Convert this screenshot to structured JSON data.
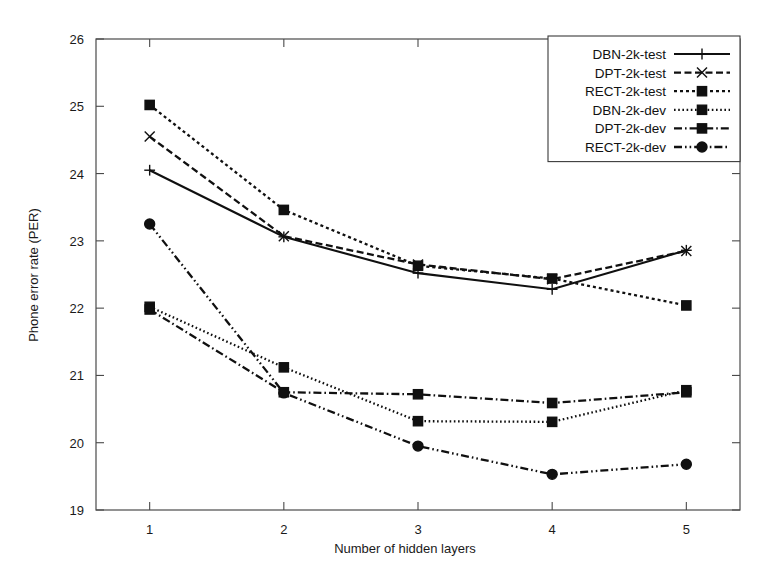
{
  "chart_data": {
    "type": "line",
    "title": "",
    "xlabel": "Number of hidden layers",
    "ylabel": "Phone error rate (PER)",
    "x": [
      1,
      2,
      3,
      4,
      5
    ],
    "xticklabels": [
      "1",
      "2",
      "3",
      "4",
      "5"
    ],
    "yticklabels": [
      "19",
      "20",
      "21",
      "22",
      "23",
      "24",
      "25",
      "26"
    ],
    "xlim": [
      0.6,
      5.4
    ],
    "ylim": [
      19,
      26
    ],
    "grid": false,
    "legend_position": "top-right",
    "series": [
      {
        "name": "DBN-2k-test",
        "marker": "plus",
        "dash": "none",
        "values": [
          24.05,
          23.06,
          22.52,
          22.28,
          22.86
        ]
      },
      {
        "name": "DPT-2k-test",
        "marker": "cross",
        "dash": "dashed",
        "values": [
          24.55,
          23.07,
          22.65,
          22.43,
          22.85
        ]
      },
      {
        "name": "RECT-2k-test",
        "marker": "square",
        "dash": "dotted",
        "values": [
          25.02,
          23.46,
          22.63,
          22.44,
          22.04
        ]
      },
      {
        "name": "DBN-2k-dev",
        "marker": "square",
        "dash": "fine-dotted",
        "values": [
          22.02,
          21.12,
          20.32,
          20.31,
          20.78
        ]
      },
      {
        "name": "DPT-2k-dev",
        "marker": "square",
        "dash": "dash-dot",
        "values": [
          21.98,
          20.75,
          20.72,
          20.59,
          20.75
        ]
      },
      {
        "name": "RECT-2k-dev",
        "marker": "circle",
        "dash": "dash-dot-dot",
        "values": [
          23.25,
          20.74,
          19.95,
          19.53,
          19.68
        ]
      }
    ]
  }
}
